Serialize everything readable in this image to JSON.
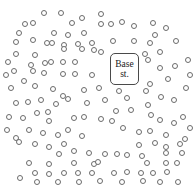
{
  "figure": {
    "background_color": "#ffffff",
    "width": 196,
    "height": 187
  },
  "base_station": {
    "label_line1": "Base",
    "label_line2": "st.",
    "x": 110,
    "y": 53,
    "width": 29,
    "height": 32,
    "border_color": "#4a4a4a",
    "fill_color": "#ffffff",
    "font_size": 9.5
  },
  "nodes": {
    "marker": "open-circle",
    "diameter": 6,
    "stroke_color": "#6b6b6b",
    "fill_color": "#ffffff",
    "count": 152,
    "points": [
      [
        44,
        13
      ],
      [
        61,
        13
      ],
      [
        33,
        23
      ],
      [
        25,
        24
      ],
      [
        82,
        18
      ],
      [
        72,
        23
      ],
      [
        101,
        14
      ],
      [
        19,
        33
      ],
      [
        54,
        33
      ],
      [
        68,
        35
      ],
      [
        84,
        33
      ],
      [
        101,
        24
      ],
      [
        111,
        24
      ],
      [
        122,
        22
      ],
      [
        134,
        26
      ],
      [
        153,
        23
      ],
      [
        166,
        28
      ],
      [
        33,
        40
      ],
      [
        16,
        42
      ],
      [
        47,
        43
      ],
      [
        52,
        43
      ],
      [
        64,
        45
      ],
      [
        78,
        44
      ],
      [
        92,
        43
      ],
      [
        113,
        41
      ],
      [
        134,
        41
      ],
      [
        155,
        35
      ],
      [
        176,
        41
      ],
      [
        150,
        43
      ],
      [
        16,
        54
      ],
      [
        35,
        55
      ],
      [
        64,
        49
      ],
      [
        82,
        49
      ],
      [
        94,
        50
      ],
      [
        101,
        52
      ],
      [
        145,
        54
      ],
      [
        160,
        52
      ],
      [
        31,
        65
      ],
      [
        45,
        63
      ],
      [
        51,
        62
      ],
      [
        63,
        62
      ],
      [
        75,
        62
      ],
      [
        148,
        60
      ],
      [
        14,
        71
      ],
      [
        33,
        71
      ],
      [
        44,
        73
      ],
      [
        63,
        74
      ],
      [
        75,
        74
      ],
      [
        92,
        75
      ],
      [
        160,
        68
      ],
      [
        175,
        66
      ],
      [
        24,
        81
      ],
      [
        35,
        86
      ],
      [
        53,
        89
      ],
      [
        84,
        90
      ],
      [
        168,
        79
      ],
      [
        150,
        84
      ],
      [
        16,
        103
      ],
      [
        28,
        102
      ],
      [
        41,
        100
      ],
      [
        56,
        104
      ],
      [
        68,
        99
      ],
      [
        87,
        103
      ],
      [
        105,
        100
      ],
      [
        127,
        98
      ],
      [
        148,
        105
      ],
      [
        161,
        97
      ],
      [
        174,
        100
      ],
      [
        37,
        113
      ],
      [
        48,
        112
      ],
      [
        116,
        111
      ],
      [
        131,
        110
      ],
      [
        151,
        115
      ],
      [
        23,
        118
      ],
      [
        49,
        121
      ],
      [
        74,
        118
      ],
      [
        84,
        117
      ],
      [
        101,
        119
      ],
      [
        112,
        121
      ],
      [
        160,
        120
      ],
      [
        174,
        123
      ],
      [
        29,
        130
      ],
      [
        43,
        133
      ],
      [
        58,
        135
      ],
      [
        68,
        130
      ],
      [
        82,
        136
      ],
      [
        123,
        128
      ],
      [
        139,
        132
      ],
      [
        150,
        131
      ],
      [
        166,
        135
      ],
      [
        185,
        139
      ],
      [
        16,
        138
      ],
      [
        19,
        142
      ],
      [
        35,
        144
      ],
      [
        49,
        147
      ],
      [
        64,
        144
      ],
      [
        74,
        151
      ],
      [
        89,
        153
      ],
      [
        59,
        154
      ],
      [
        139,
        145
      ],
      [
        155,
        143
      ],
      [
        166,
        147
      ],
      [
        180,
        144
      ],
      [
        29,
        163
      ],
      [
        49,
        164
      ],
      [
        74,
        163
      ],
      [
        94,
        164
      ],
      [
        105,
        154
      ],
      [
        117,
        154
      ],
      [
        127,
        155
      ],
      [
        142,
        156
      ],
      [
        166,
        153
      ],
      [
        182,
        153
      ],
      [
        98,
        162
      ],
      [
        147,
        163
      ],
      [
        166,
        163
      ],
      [
        177,
        163
      ],
      [
        35,
        173
      ],
      [
        49,
        174
      ],
      [
        64,
        173
      ],
      [
        78,
        173
      ],
      [
        92,
        173
      ],
      [
        114,
        173
      ],
      [
        127,
        172
      ],
      [
        141,
        173
      ],
      [
        153,
        173
      ],
      [
        167,
        172
      ],
      [
        6,
        75
      ],
      [
        8,
        62
      ],
      [
        11,
        88
      ],
      [
        188,
        60
      ],
      [
        190,
        75
      ],
      [
        186,
        88
      ],
      [
        124,
        64
      ],
      [
        99,
        88
      ],
      [
        146,
        91
      ],
      [
        119,
        91
      ],
      [
        63,
        96
      ],
      [
        183,
        117
      ],
      [
        190,
        128
      ],
      [
        9,
        117
      ],
      [
        7,
        130
      ],
      [
        178,
        182
      ],
      [
        160,
        182
      ],
      [
        143,
        181
      ],
      [
        122,
        182
      ],
      [
        100,
        181
      ],
      [
        79,
        182
      ],
      [
        58,
        182
      ],
      [
        37,
        182
      ],
      [
        20,
        178
      ]
    ]
  }
}
